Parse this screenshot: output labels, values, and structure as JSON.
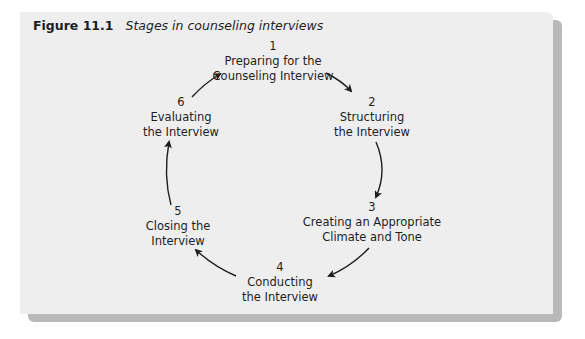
{
  "figure": {
    "number": "Figure 11.1",
    "title": "Stages in counseling interviews"
  },
  "stages": [
    {
      "n": "1",
      "line1": "Preparing for the",
      "line2": "Counseling Interview"
    },
    {
      "n": "2",
      "line1": "Structuring",
      "line2": "the Interview"
    },
    {
      "n": "3",
      "line1": "Creating an Appropriate",
      "line2": "Climate and Tone"
    },
    {
      "n": "4",
      "line1": "Conducting",
      "line2": "the Interview"
    },
    {
      "n": "5",
      "line1": "Closing the",
      "line2": "Interview"
    },
    {
      "n": "6",
      "line1": "Evaluating",
      "line2": "the Interview"
    }
  ],
  "colors": {
    "panel": "#eeeeee",
    "shadow": "#b9b9b9",
    "text": "#1e1e1e"
  }
}
